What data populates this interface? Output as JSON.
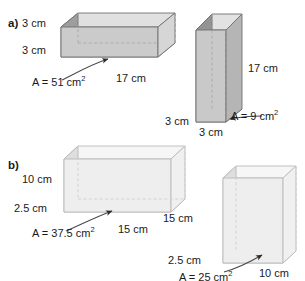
{
  "page": {
    "background": "#ffffff",
    "width": 305,
    "height": 281,
    "cut_off_text_top": ""
  },
  "parts": [
    {
      "id": "a",
      "letter_label": "a)",
      "figures": [
        {
          "id": "a-wide-prism",
          "orientation": "horizontal",
          "fill_front": "#c9c9c9",
          "fill_top": "#dcdcdc",
          "fill_left": "#9a9a9a",
          "labels": {
            "height": "3 cm",
            "depth": "3 cm",
            "length": "17 cm",
            "area": "A = 51 cm2",
            "area_value": "51",
            "area_unit": "cm",
            "area_exp": "2"
          }
        },
        {
          "id": "a-tall-prism",
          "orientation": "vertical",
          "fill_front": "#c9c9c9",
          "fill_top": "#dcdcdc",
          "fill_left": "#8f8f8f",
          "labels": {
            "height": "17 cm",
            "depth": "3 cm",
            "width": "3 cm",
            "area": "A = 9 cm2",
            "area_value": "9",
            "area_unit": "cm",
            "area_exp": "2"
          }
        }
      ]
    },
    {
      "id": "b",
      "letter_label": "b)",
      "figures": [
        {
          "id": "b-wide-box",
          "orientation": "horizontal",
          "fill_front": "#efefef",
          "fill_top": "#f7f7f7",
          "fill_left": "#dcdcdc",
          "labels": {
            "height": "10 cm",
            "depth": "2.5 cm",
            "length": "15 cm",
            "area": "A = 37.5 cm2",
            "area_value": "37.5",
            "area_unit": "cm",
            "area_exp": "2"
          }
        },
        {
          "id": "b-tall-box",
          "orientation": "vertical",
          "fill_front": "#efefef",
          "fill_top": "#f7f7f7",
          "fill_left": "#dcdcdc",
          "labels": {
            "height": "15 cm",
            "depth": "2.5 cm",
            "width": "10 cm",
            "area": "A = 25 cm2",
            "area_value": "25",
            "area_unit": "cm",
            "area_exp": "2"
          }
        }
      ]
    }
  ],
  "text": {
    "a_letter": "a)",
    "b_letter": "b)",
    "a1_h": "3 cm",
    "a1_d": "3 cm",
    "a1_len": "17 cm",
    "a1_area_eq": "A = 51 cm",
    "a1_area_sup": "2",
    "a2_h": "17 cm",
    "a2_d": "3 cm",
    "a2_w": "3 cm",
    "a2_area_eq": "A = 9 cm",
    "a2_area_sup": "2",
    "b1_h": "10 cm",
    "b1_d": "2.5 cm",
    "b1_len": "15 cm",
    "b1_area_eq": "A = 37.5 cm",
    "b1_area_sup": "2",
    "b2_h": "15 cm",
    "b2_d": "2.5 cm",
    "b2_w": "10 cm",
    "b2_area_eq": "A = 25 cm",
    "b2_area_sup": "2"
  },
  "colors": {
    "outline": "#6f6f6f",
    "outline_light": "#b4b4b4",
    "hatch": "#8a8a8a",
    "dash": "#a8a8a8",
    "leader": "#3a3a3a",
    "text": "#1a1a1a"
  }
}
